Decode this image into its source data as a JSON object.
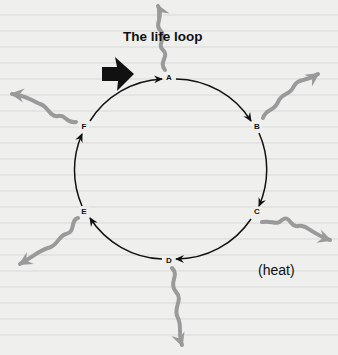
{
  "title": "The life loop",
  "heat_label": "(heat)",
  "nodes": [
    {
      "id": "A",
      "label": "A"
    },
    {
      "id": "B",
      "label": "B"
    },
    {
      "id": "C",
      "label": "C"
    },
    {
      "id": "D",
      "label": "D"
    },
    {
      "id": "E",
      "label": "E"
    },
    {
      "id": "F",
      "label": "F"
    }
  ],
  "flow": [
    "A",
    "B",
    "C",
    "D",
    "E",
    "F",
    "A"
  ],
  "entry_arrow": {
    "target": "A",
    "color": "#111111"
  },
  "heat_arrows_from": [
    "A",
    "B",
    "C",
    "D",
    "E",
    "F"
  ],
  "colors": {
    "cycle": "#111111",
    "heat": "#9a9a9a",
    "background": "#efefee"
  }
}
